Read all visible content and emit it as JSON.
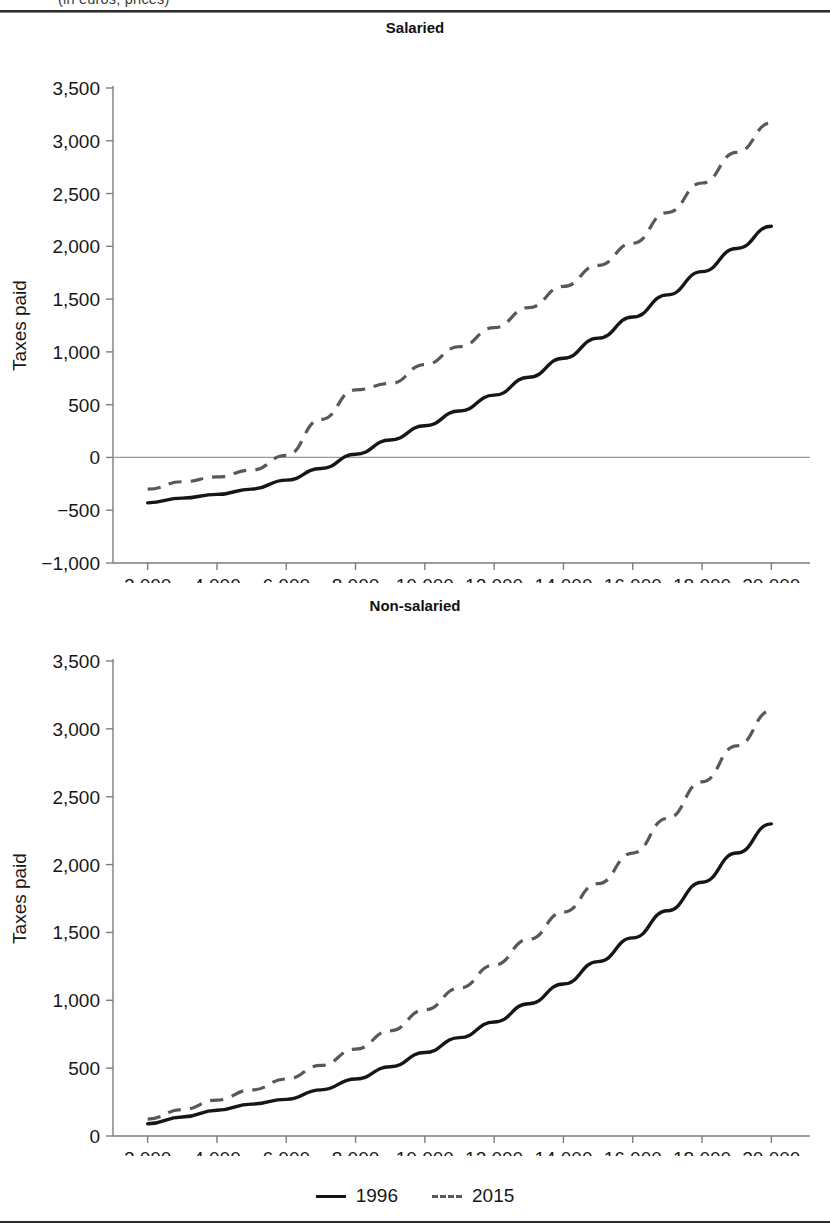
{
  "document": {
    "clipped_caption": "(in euros, prices)",
    "legend": {
      "items": [
        {
          "label": "1996",
          "style": "solid",
          "color": "#161616"
        },
        {
          "label": "2015",
          "style": "dashed",
          "color": "#585858"
        }
      ]
    }
  },
  "chart_data": [
    {
      "type": "line",
      "title": "Salaried",
      "xlabel": "",
      "ylabel": "Taxes paid",
      "xlim": [
        1000,
        21000
      ],
      "ylim": [
        -1000,
        3500
      ],
      "xticks": [
        2000,
        4000,
        6000,
        8000,
        10000,
        12000,
        14000,
        16000,
        18000,
        20000
      ],
      "xticklabels": [
        "2,000",
        "4,000",
        "6,000",
        "8,000",
        "10,000",
        "12,000",
        "14,000",
        "16,000",
        "18,000",
        "20,000"
      ],
      "yticks": [
        -1000,
        -500,
        0,
        500,
        1000,
        1500,
        2000,
        2500,
        3000,
        3500
      ],
      "yticklabels": [
        "−1,000",
        "−500",
        "0",
        "500",
        "1,000",
        "1,500",
        "2,000",
        "2,500",
        "3,000",
        "3,500"
      ],
      "grid": false,
      "zero_line": true,
      "legend_position": "bottom",
      "x": [
        2000,
        3000,
        4000,
        5000,
        6000,
        7000,
        8000,
        9000,
        10000,
        11000,
        12000,
        13000,
        14000,
        15000,
        16000,
        17000,
        18000,
        19000,
        20000
      ],
      "series": [
        {
          "name": "1996",
          "style": "solid",
          "values": [
            -430,
            -385,
            -350,
            -300,
            -215,
            -105,
            30,
            165,
            300,
            440,
            590,
            760,
            940,
            1130,
            1330,
            1540,
            1760,
            1980,
            2190
          ]
        },
        {
          "name": "2015",
          "style": "dashed",
          "values": [
            -300,
            -230,
            -185,
            -120,
            20,
            360,
            640,
            700,
            880,
            1050,
            1230,
            1420,
            1620,
            1820,
            2030,
            2320,
            2600,
            2890,
            3170
          ]
        }
      ]
    },
    {
      "type": "line",
      "title": "Non-salaried",
      "xlabel": "",
      "ylabel": "Taxes paid",
      "xlim": [
        1000,
        21000
      ],
      "ylim": [
        0,
        3500
      ],
      "xticks": [
        2000,
        4000,
        6000,
        8000,
        10000,
        12000,
        14000,
        16000,
        18000,
        20000
      ],
      "xticklabels": [
        "2,000",
        "4,000",
        "6,000",
        "8,000",
        "10,000",
        "12,000",
        "14,000",
        "16,000",
        "18,000",
        "20,000"
      ],
      "yticks": [
        0,
        500,
        1000,
        1500,
        2000,
        2500,
        3000,
        3500
      ],
      "yticklabels": [
        "0",
        "500",
        "1,000",
        "1,500",
        "2,000",
        "2,500",
        "3,000",
        "3,500"
      ],
      "grid": false,
      "zero_line": false,
      "legend_position": "bottom",
      "x": [
        2000,
        3000,
        4000,
        5000,
        6000,
        7000,
        8000,
        9000,
        10000,
        11000,
        12000,
        13000,
        14000,
        15000,
        16000,
        17000,
        18000,
        19000,
        20000
      ],
      "series": [
        {
          "name": "1996",
          "style": "solid",
          "values": [
            90,
            140,
            190,
            235,
            270,
            340,
            420,
            510,
            615,
            725,
            840,
            975,
            1120,
            1285,
            1460,
            1660,
            1870,
            2085,
            2300
          ]
        },
        {
          "name": "2015",
          "style": "dashed",
          "values": [
            125,
            195,
            265,
            340,
            420,
            520,
            640,
            775,
            930,
            1090,
            1260,
            1450,
            1650,
            1860,
            2085,
            2340,
            2610,
            2875,
            3135
          ]
        }
      ]
    }
  ]
}
